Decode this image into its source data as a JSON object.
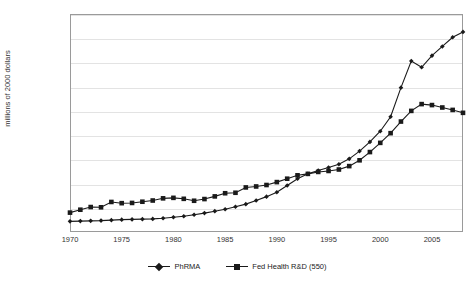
{
  "chart_data": {
    "type": "line",
    "title": "",
    "xlabel": "",
    "ylabel": "millions of 2000 dollars",
    "xlim": [
      1970,
      2008
    ],
    "ylim": [
      0,
      45000
    ],
    "grid": true,
    "legend_position": "bottom",
    "ytick_labels": [
      "0",
      "5000",
      "10000",
      "15000",
      "20000",
      "25000",
      "30000",
      "35000",
      "40000",
      "45000"
    ],
    "ytick_values": [
      0,
      5000,
      10000,
      15000,
      20000,
      25000,
      30000,
      35000,
      40000,
      45000
    ],
    "xtick_labels": [
      "1970",
      "1975",
      "1980",
      "1985",
      "1990",
      "1995",
      "2000",
      "2005"
    ],
    "xtick_values": [
      1970,
      1975,
      1980,
      1985,
      1990,
      1995,
      2000,
      2005
    ],
    "x": [
      1970,
      1971,
      1972,
      1973,
      1974,
      1975,
      1976,
      1977,
      1978,
      1979,
      1980,
      1981,
      1982,
      1983,
      1984,
      1985,
      1986,
      1987,
      1988,
      1989,
      1990,
      1991,
      1992,
      1993,
      1994,
      1995,
      1996,
      1997,
      1998,
      1999,
      2000,
      2001,
      2002,
      2003,
      2004,
      2005,
      2006,
      2007,
      2008
    ],
    "series": [
      {
        "name": "PhRMA",
        "marker": "diamond",
        "color": "#1a1a1a",
        "values": [
          2200,
          2250,
          2300,
          2350,
          2450,
          2550,
          2600,
          2650,
          2700,
          2850,
          3050,
          3250,
          3550,
          3900,
          4300,
          4700,
          5200,
          5750,
          6500,
          7300,
          8200,
          9600,
          11000,
          12000,
          12700,
          13300,
          14000,
          15100,
          16700,
          18600,
          20800,
          23800,
          29800,
          35300,
          34000,
          36400,
          38300,
          40200,
          41300
        ]
      },
      {
        "name": "Fed Health R&D (550)",
        "marker": "square",
        "color": "#1a1a1a",
        "values": [
          4000,
          4600,
          5150,
          5100,
          6200,
          5950,
          6000,
          6250,
          6500,
          6950,
          7050,
          6850,
          6450,
          6800,
          7350,
          8000,
          8100,
          9200,
          9400,
          9700,
          10300,
          11000,
          11700,
          12000,
          12400,
          12600,
          12900,
          13600,
          14800,
          16500,
          18400,
          20400,
          22800,
          25000,
          26400,
          26200,
          25700,
          25200,
          24600
        ]
      }
    ]
  }
}
